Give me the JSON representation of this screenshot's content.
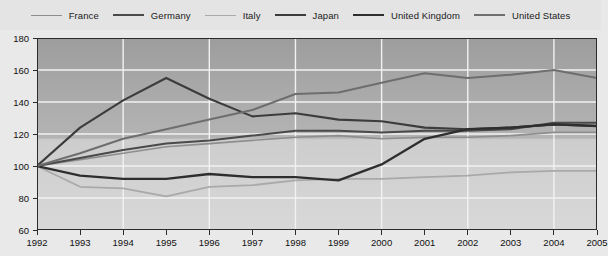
{
  "chart_data": {
    "type": "line",
    "title": "",
    "subtitle": "",
    "xlabel": "",
    "ylabel": "",
    "x": [
      1992,
      1993,
      1994,
      1995,
      1996,
      1997,
      1998,
      1999,
      2000,
      2001,
      2002,
      2003,
      2004,
      2005
    ],
    "xtick_labels": [
      "1992",
      "1993",
      "1994",
      "1995",
      "1996",
      "1997",
      "1998",
      "1999",
      "2000",
      "2001",
      "2002",
      "2003",
      "2004",
      "2005"
    ],
    "ytick_labels": [
      "60",
      "80",
      "100",
      "120",
      "140",
      "160",
      "180"
    ],
    "yticks": [
      60,
      80,
      100,
      120,
      140,
      160,
      180
    ],
    "ylim": [
      60,
      180
    ],
    "xlim": [
      1992,
      2005
    ],
    "grid": true,
    "legend_position": "top",
    "series": [
      {
        "name": "France",
        "color": "#8e8e8e",
        "width": 1.6,
        "values": [
          100,
          104,
          108,
          112,
          114,
          116,
          118,
          119,
          117,
          118,
          118,
          119,
          121,
          121
        ]
      },
      {
        "name": "Germany",
        "color": "#4a4a4a",
        "width": 2.0,
        "values": [
          100,
          105,
          110,
          114,
          116,
          119,
          122,
          122,
          121,
          122,
          122,
          123,
          127,
          127
        ]
      },
      {
        "name": "Italy",
        "color": "#a9a9a9",
        "width": 1.8,
        "values": [
          100,
          87,
          86,
          81,
          87,
          88,
          91,
          92,
          92,
          93,
          94,
          96,
          97,
          97
        ]
      },
      {
        "name": "Japan",
        "color": "#3c3c3c",
        "width": 2.1,
        "values": [
          100,
          124,
          141,
          155,
          142,
          131,
          133,
          129,
          128,
          124,
          123,
          124,
          126,
          125
        ]
      },
      {
        "name": "United Kingdom",
        "color": "#2e2e2e",
        "width": 2.3,
        "values": [
          100,
          94,
          92,
          92,
          95,
          93,
          93,
          91,
          101,
          117,
          123,
          124,
          126,
          125
        ]
      },
      {
        "name": "United States",
        "color": "#6e6e6e",
        "width": 2.0,
        "values": [
          100,
          108,
          117,
          123,
          129,
          135,
          145,
          146,
          152,
          158,
          155,
          157,
          160,
          155
        ]
      }
    ]
  },
  "legend": {
    "items": [
      {
        "label": "France"
      },
      {
        "label": "Germany"
      },
      {
        "label": "Italy"
      },
      {
        "label": "Japan"
      },
      {
        "label": "United Kingdom"
      },
      {
        "label": "United States"
      }
    ]
  },
  "colors": {
    "page_background": "#e9e9e9",
    "legend_background": "#e4e4e4",
    "plot_top": "#9d9d9d",
    "plot_bottom": "#d6d6d6",
    "gridline": "#f2f2f2",
    "axis": "#2b2b2b",
    "text": "#111111"
  }
}
